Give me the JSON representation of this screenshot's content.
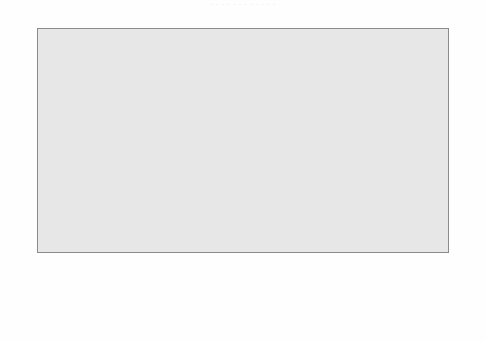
{
  "title_strip": "·  ·   ·  ·    ·  ·   ·   ·  ·     ·   ·  ·",
  "colors": {
    "plot_background": "#e7e7e7",
    "bar_fill": "#e7e7e7",
    "bar_border": "#6d6d6d",
    "highlight_fill": "#5d5d5d",
    "highlight_border": "#3a3a3a",
    "frame": "#8b8b8b",
    "text": "#1a1a1a"
  },
  "chart_data": {
    "type": "bar",
    "title": "",
    "xlabel": "",
    "ylabel": "",
    "ylim": [
      0,
      90
    ],
    "yticks": [
      0,
      10,
      20,
      30,
      40,
      50,
      60,
      70,
      80,
      90
    ],
    "grid": false,
    "legend": "none",
    "dual_axis": true,
    "highlight_category": "AUSTRALIA",
    "categories": [
      "Sweden",
      "Netherlands",
      "Belgium (Fl)",
      "Canada",
      "Switzerland (G)",
      "Switzerland (Fr)",
      "Germany",
      "AUSTRALIA",
      "United Kingdom",
      "New Zealand",
      "Ireland",
      "United States",
      "Poland"
    ],
    "values": [
      80,
      76.5,
      76,
      67,
      67,
      65.5,
      65,
      61,
      54.5,
      51.5,
      49,
      43,
      33.5
    ]
  }
}
